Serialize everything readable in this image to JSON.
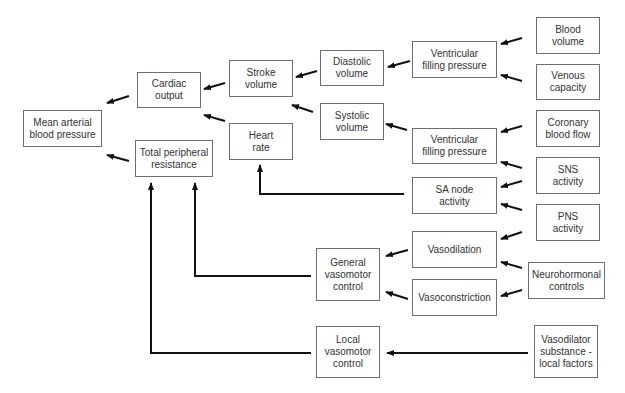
{
  "diagram": {
    "nodes": [
      {
        "id": "map",
        "label": "Mean arterial\nblood pressure",
        "x": 23,
        "y": 110,
        "w": 79,
        "h": 37
      },
      {
        "id": "co",
        "label": "Cardiac\noutput",
        "x": 137,
        "y": 72,
        "w": 64,
        "h": 36
      },
      {
        "id": "tpr",
        "label": "Total peripheral\nresistance",
        "x": 135,
        "y": 140,
        "w": 78,
        "h": 37
      },
      {
        "id": "sv",
        "label": "Stroke\nvolume",
        "x": 229,
        "y": 60,
        "w": 64,
        "h": 37
      },
      {
        "id": "hr",
        "label": "Heart\nrate",
        "x": 229,
        "y": 123,
        "w": 64,
        "h": 37
      },
      {
        "id": "dv",
        "label": "Diastolic\nvolume",
        "x": 320,
        "y": 50,
        "w": 64,
        "h": 36
      },
      {
        "id": "sysv",
        "label": "Systolic\nvolume",
        "x": 320,
        "y": 103,
        "w": 64,
        "h": 37
      },
      {
        "id": "vfp1",
        "label": "Ventricular\nfilling pressure",
        "x": 412,
        "y": 41,
        "w": 85,
        "h": 37
      },
      {
        "id": "vfp2",
        "label": "Ventricular\nfilling pressure",
        "x": 412,
        "y": 128,
        "w": 85,
        "h": 36
      },
      {
        "id": "sa",
        "label": "SA node\nactivity",
        "x": 412,
        "y": 177,
        "w": 85,
        "h": 37
      },
      {
        "id": "vdil",
        "label": "Vasodilation",
        "x": 412,
        "y": 231,
        "w": 85,
        "h": 37
      },
      {
        "id": "vcon",
        "label": "Vasoconstriction",
        "x": 412,
        "y": 279,
        "w": 85,
        "h": 37
      },
      {
        "id": "gvc",
        "label": "General\nvasomotor\ncontrol",
        "x": 316,
        "y": 248,
        "w": 64,
        "h": 53
      },
      {
        "id": "lvc",
        "label": "Local\nvasomotor\ncontrol",
        "x": 316,
        "y": 326,
        "w": 64,
        "h": 52
      },
      {
        "id": "bv",
        "label": "Blood\nvolume",
        "x": 536,
        "y": 17,
        "w": 64,
        "h": 37
      },
      {
        "id": "vc",
        "label": "Venous\ncapacity",
        "x": 536,
        "y": 64,
        "w": 64,
        "h": 36
      },
      {
        "id": "cbf",
        "label": "Coronary\nblood flow",
        "x": 536,
        "y": 110,
        "w": 64,
        "h": 37
      },
      {
        "id": "sns",
        "label": "SNS\nactivity",
        "x": 536,
        "y": 157,
        "w": 64,
        "h": 37
      },
      {
        "id": "pns",
        "label": "PNS\nactivity",
        "x": 536,
        "y": 204,
        "w": 64,
        "h": 37
      },
      {
        "id": "nh",
        "label": "Neurohormonal\ncontrols",
        "x": 528,
        "y": 262,
        "w": 77,
        "h": 37
      },
      {
        "id": "vsub",
        "label": "Vasodilator\nsubstance -\nlocal factors",
        "x": 534,
        "y": 325,
        "w": 64,
        "h": 53
      }
    ],
    "short_arrows": [
      {
        "from": "co",
        "to": "map",
        "x1": 129,
        "y1": 96,
        "x2": 107,
        "y2": 103
      },
      {
        "from": "tpr",
        "to": "map",
        "x1": 129,
        "y1": 161,
        "x2": 107,
        "y2": 155
      },
      {
        "from": "sv",
        "to": "co",
        "x1": 225,
        "y1": 83,
        "x2": 204,
        "y2": 89
      },
      {
        "from": "hr",
        "to": "co",
        "x1": 225,
        "y1": 121,
        "x2": 204,
        "y2": 115
      },
      {
        "from": "dv",
        "to": "sv",
        "x1": 317,
        "y1": 71,
        "x2": 296,
        "y2": 77
      },
      {
        "from": "sysv",
        "to": "sv",
        "x1": 313,
        "y1": 112,
        "x2": 292,
        "y2": 105
      },
      {
        "from": "vfp1",
        "to": "dv",
        "x1": 410,
        "y1": 61,
        "x2": 388,
        "y2": 67
      },
      {
        "from": "vfp2",
        "to": "sysv",
        "x1": 407,
        "y1": 130,
        "x2": 386,
        "y2": 124
      },
      {
        "from": "bv",
        "to": "vfp1",
        "x1": 522,
        "y1": 38,
        "x2": 501,
        "y2": 44
      },
      {
        "from": "vc",
        "to": "vfp1",
        "x1": 522,
        "y1": 81,
        "x2": 501,
        "y2": 75
      },
      {
        "from": "cbf",
        "to": "vfp2",
        "x1": 522,
        "y1": 126,
        "x2": 501,
        "y2": 132
      },
      {
        "from": "sns",
        "to": "vfp2",
        "x1": 522,
        "y1": 168,
        "x2": 501,
        "y2": 162
      },
      {
        "from": "sns",
        "to": "sa",
        "x1": 522,
        "y1": 181,
        "x2": 501,
        "y2": 187
      },
      {
        "from": "pns",
        "to": "sa",
        "x1": 522,
        "y1": 210,
        "x2": 501,
        "y2": 204
      },
      {
        "from": "pns",
        "to": "vdil",
        "x1": 522,
        "y1": 232,
        "x2": 501,
        "y2": 239
      },
      {
        "from": "nh",
        "to": "vdil",
        "x1": 522,
        "y1": 268,
        "x2": 501,
        "y2": 262
      },
      {
        "from": "nh",
        "to": "vcon",
        "x1": 522,
        "y1": 290,
        "x2": 501,
        "y2": 296
      },
      {
        "from": "vdil",
        "to": "gvc",
        "x1": 408,
        "y1": 250,
        "x2": 386,
        "y2": 256
      },
      {
        "from": "vcon",
        "to": "gvc",
        "x1": 408,
        "y1": 299,
        "x2": 386,
        "y2": 292
      },
      {
        "from": "vsub",
        "to": "lvc",
        "x1": 528,
        "y1": 353,
        "x2": 387,
        "y2": 353
      }
    ],
    "elbow_connectors": [
      {
        "from": "sa",
        "to": "hr",
        "points": "404,194 260,194 260,165"
      },
      {
        "from": "gvc",
        "to": "tpr",
        "points": "311,276 195,276 195,183"
      },
      {
        "from": "lvc",
        "to": "tpr",
        "points": "311,353 151,353 151,183"
      }
    ]
  }
}
